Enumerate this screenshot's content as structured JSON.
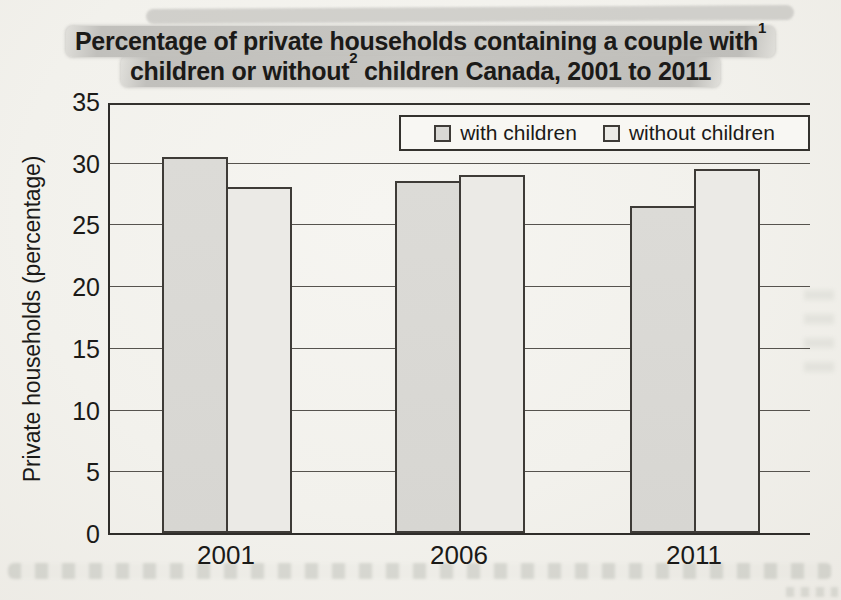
{
  "title": {
    "line1": "Percentage of private households containing a couple with",
    "line1_sup": "1",
    "line2_pre": "children or without",
    "line2_sup": "2",
    "line2_post": " children Canada, 2001 to 2011",
    "highlight_color": "#c3c2be"
  },
  "chart_data": {
    "type": "bar",
    "categories": [
      "2001",
      "2006",
      "2011"
    ],
    "series": [
      {
        "name": "with children",
        "values": [
          30.5,
          28.5,
          26.5
        ],
        "color": "#d9d8d4"
      },
      {
        "name": "without children",
        "values": [
          28.0,
          29.0,
          29.5
        ],
        "color": "#ebeae6"
      }
    ],
    "xlabel": "",
    "ylabel": "Private households (percentage)",
    "ylim": [
      0,
      35
    ],
    "yticks": [
      0,
      5,
      10,
      15,
      20,
      25,
      30,
      35
    ],
    "grid": "horizontal",
    "legend_position": "top-right-inside",
    "bar_border_color": "#3e3b37",
    "gridline_color": "#56534e"
  }
}
